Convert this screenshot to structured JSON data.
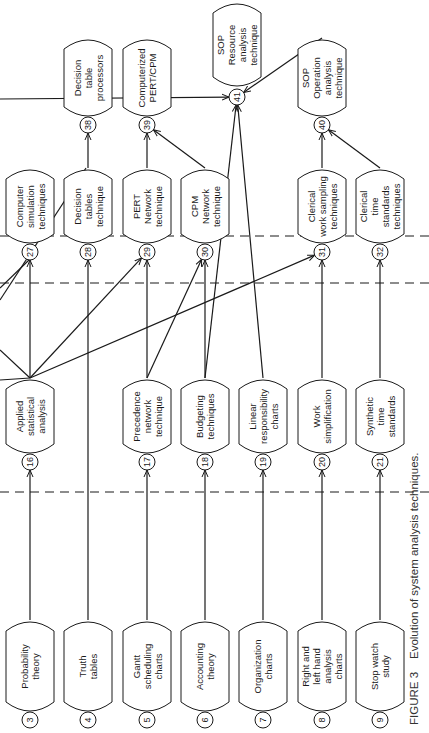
{
  "figure": {
    "caption_label": "FIGURE 3",
    "caption_text": "Evolution of system analysis techniques.",
    "orientation": "rotated 90 degrees counter-clockwise"
  },
  "nodes": [
    {
      "id": "3",
      "lines": [
        "Probability",
        "theory"
      ]
    },
    {
      "id": "4",
      "lines": [
        "Truth",
        "tables"
      ]
    },
    {
      "id": "5",
      "lines": [
        "Gantt",
        "scheduling",
        "charts"
      ]
    },
    {
      "id": "6",
      "lines": [
        "Accounting",
        "theory"
      ]
    },
    {
      "id": "7",
      "lines": [
        "Organization",
        "charts"
      ]
    },
    {
      "id": "8",
      "lines": [
        "Right and",
        "left hand",
        "analysis",
        "charts"
      ]
    },
    {
      "id": "9",
      "lines": [
        "Stop watch",
        "study"
      ]
    },
    {
      "id": "16",
      "lines": [
        "Applied",
        "statistical",
        "analysis"
      ]
    },
    {
      "id": "17",
      "lines": [
        "Precedence",
        "network",
        "technique"
      ]
    },
    {
      "id": "18",
      "lines": [
        "Budgeting",
        "techniques"
      ]
    },
    {
      "id": "19",
      "lines": [
        "Linear",
        "responsibility",
        "charts"
      ]
    },
    {
      "id": "20",
      "lines": [
        "Work",
        "simplification"
      ]
    },
    {
      "id": "21",
      "lines": [
        "Synthetic",
        "time",
        "standards"
      ]
    },
    {
      "id": "27",
      "lines": [
        "Computer",
        "simulation",
        "techniques"
      ]
    },
    {
      "id": "28",
      "lines": [
        "Decision",
        "tables",
        "technique"
      ]
    },
    {
      "id": "29",
      "lines": [
        "PERT",
        "Network",
        "technique"
      ]
    },
    {
      "id": "30",
      "lines": [
        "CPM",
        "Network",
        "technique"
      ]
    },
    {
      "id": "31",
      "lines": [
        "Clerical",
        "work sampling",
        "techniques"
      ]
    },
    {
      "id": "32",
      "lines": [
        "Clerical",
        "time",
        "standards",
        "techniques"
      ]
    },
    {
      "id": "38",
      "lines": [
        "Decision",
        "table",
        "processors"
      ]
    },
    {
      "id": "39",
      "lines": [
        "Computerized",
        "PERT/CPM"
      ]
    },
    {
      "id": "40",
      "lines": [
        "SOP",
        "Operation",
        "analysis",
        "technique"
      ]
    },
    {
      "id": "41",
      "lines": [
        "SOP",
        "Resource",
        "analysis",
        "technique"
      ]
    }
  ],
  "edges": [
    {
      "from": "3",
      "to": "16"
    },
    {
      "from": "4",
      "to": "28"
    },
    {
      "from": "5",
      "to": "17"
    },
    {
      "from": "6",
      "to": "18"
    },
    {
      "from": "7",
      "to": "19"
    },
    {
      "from": "8",
      "to": "20"
    },
    {
      "from": "9",
      "to": "21"
    },
    {
      "from": "16",
      "to": "27"
    },
    {
      "from": "16",
      "to": "29"
    },
    {
      "from": "16",
      "to": "31"
    },
    {
      "from": "16",
      "to": "offpage"
    },
    {
      "from": "16",
      "to": "offpage"
    },
    {
      "from": "17",
      "to": "29"
    },
    {
      "from": "17",
      "to": "30"
    },
    {
      "from": "18",
      "to": "30"
    },
    {
      "from": "18",
      "to": "41"
    },
    {
      "from": "19",
      "to": "41"
    },
    {
      "from": "20",
      "to": "31"
    },
    {
      "from": "21",
      "to": "32"
    },
    {
      "from": "offpage",
      "to": "27"
    },
    {
      "from": "offpage",
      "to": "28"
    },
    {
      "from": "28",
      "to": "38"
    },
    {
      "from": "29",
      "to": "39"
    },
    {
      "from": "30",
      "to": "39"
    },
    {
      "from": "31",
      "to": "40"
    },
    {
      "from": "32",
      "to": "40"
    },
    {
      "from": "40",
      "to": "41"
    },
    {
      "from": "offpage",
      "to": "41"
    }
  ]
}
